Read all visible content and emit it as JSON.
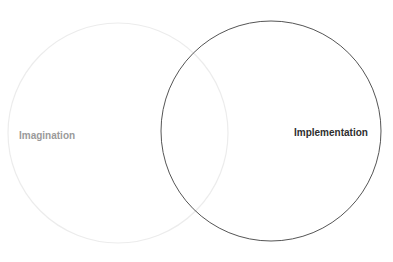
{
  "diagram": {
    "type": "venn",
    "sets": [
      {
        "label": "Imagination",
        "stroke": "#ececec",
        "text_color": "#9a9a9a"
      },
      {
        "label": "Implementation",
        "stroke": "#555555",
        "text_color": "#2e2e2e"
      }
    ]
  }
}
